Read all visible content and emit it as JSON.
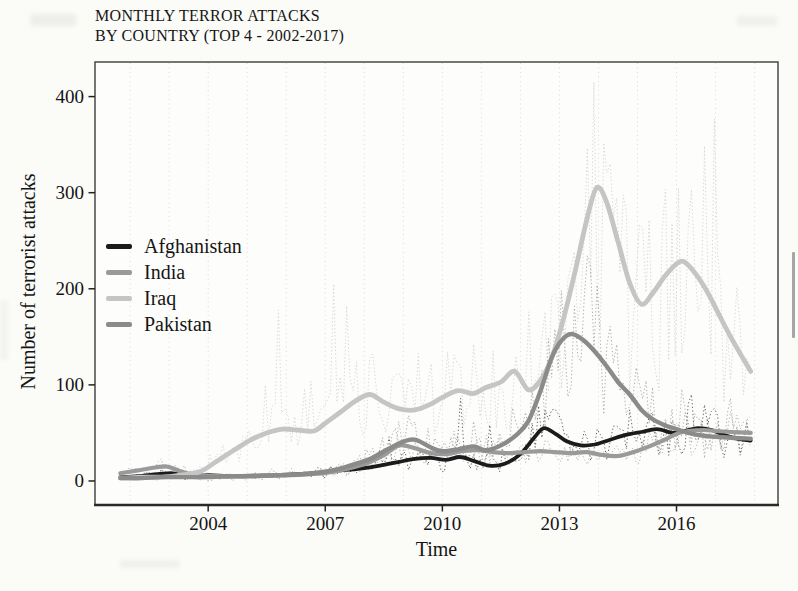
{
  "page": {
    "background": "#fbfbf8",
    "kind": "scanned book figure"
  },
  "chart_data": {
    "type": "line",
    "title_lines": [
      "MONTHLY TERROR ATTACKS",
      "BY COUNTRY (TOP 4 - 2002-2017)"
    ],
    "xlabel": "Time",
    "ylabel": "Number of terrorist attacks",
    "x_ticks": [
      2004,
      2007,
      2010,
      2013,
      2016
    ],
    "y_ticks": [
      0,
      100,
      200,
      300,
      400
    ],
    "xlim": [
      2001.1,
      2018.6
    ],
    "ylim": [
      -25,
      436
    ],
    "grid_years": [
      2002,
      2003,
      2004,
      2005,
      2006,
      2007,
      2008,
      2009,
      2010,
      2011,
      2012,
      2013,
      2014,
      2015,
      2016,
      2017,
      2018
    ],
    "grid_style": "dotted-vertical",
    "legend_position": "inside-left-middle",
    "has_raw_monthly_dotted": true,
    "series": [
      {
        "name": "Afghanistan",
        "color": "#1b1b1b",
        "raw_color": "#4d4d4d",
        "points": [
          [
            2001.75,
            4
          ],
          [
            2002.2,
            5
          ],
          [
            2002.7,
            7
          ],
          [
            2003.1,
            8
          ],
          [
            2003.5,
            5
          ],
          [
            2004.0,
            6
          ],
          [
            2004.5,
            5
          ],
          [
            2005.1,
            5
          ],
          [
            2005.7,
            6
          ],
          [
            2006.3,
            7
          ],
          [
            2006.9,
            9
          ],
          [
            2007.4,
            11
          ],
          [
            2007.9,
            13
          ],
          [
            2008.4,
            16
          ],
          [
            2008.9,
            20
          ],
          [
            2009.3,
            23
          ],
          [
            2009.7,
            24
          ],
          [
            2010.1,
            22
          ],
          [
            2010.45,
            25
          ],
          [
            2010.8,
            21
          ],
          [
            2011.2,
            16
          ],
          [
            2011.6,
            18
          ],
          [
            2012.0,
            28
          ],
          [
            2012.35,
            45
          ],
          [
            2012.6,
            55
          ],
          [
            2012.9,
            49
          ],
          [
            2013.2,
            41
          ],
          [
            2013.55,
            37
          ],
          [
            2013.9,
            38
          ],
          [
            2014.3,
            43
          ],
          [
            2014.7,
            48
          ],
          [
            2015.1,
            51
          ],
          [
            2015.5,
            54
          ],
          [
            2015.9,
            50
          ],
          [
            2016.2,
            52
          ],
          [
            2016.55,
            55
          ],
          [
            2016.9,
            53
          ],
          [
            2017.2,
            48
          ],
          [
            2017.55,
            44
          ],
          [
            2017.9,
            42
          ]
        ],
        "raw_spikes": [
          [
            2008.6,
            46
          ],
          [
            2010.5,
            86
          ],
          [
            2011.2,
            58
          ],
          [
            2012.5,
            78
          ],
          [
            2013.0,
            70
          ],
          [
            2014.8,
            74
          ],
          [
            2015.3,
            66
          ],
          [
            2016.35,
            90
          ],
          [
            2016.9,
            72
          ]
        ]
      },
      {
        "name": "India",
        "color": "#9a9a9a",
        "raw_color": "#ababab",
        "points": [
          [
            2001.75,
            8
          ],
          [
            2002.2,
            11
          ],
          [
            2002.65,
            14
          ],
          [
            2002.95,
            15
          ],
          [
            2003.3,
            10
          ],
          [
            2003.7,
            6
          ],
          [
            2004.2,
            5
          ],
          [
            2004.8,
            5
          ],
          [
            2005.4,
            6
          ],
          [
            2006.0,
            6
          ],
          [
            2006.6,
            7
          ],
          [
            2007.1,
            9
          ],
          [
            2007.6,
            13
          ],
          [
            2008.1,
            19
          ],
          [
            2008.5,
            27
          ],
          [
            2008.9,
            37
          ],
          [
            2009.3,
            34
          ],
          [
            2009.7,
            29
          ],
          [
            2010.1,
            28
          ],
          [
            2010.5,
            31
          ],
          [
            2010.9,
            32
          ],
          [
            2011.3,
            30
          ],
          [
            2011.7,
            29
          ],
          [
            2012.1,
            30
          ],
          [
            2012.5,
            31
          ],
          [
            2012.9,
            30
          ],
          [
            2013.3,
            29
          ],
          [
            2013.7,
            30
          ],
          [
            2014.1,
            27
          ],
          [
            2014.5,
            26
          ],
          [
            2014.9,
            30
          ],
          [
            2015.3,
            36
          ],
          [
            2015.7,
            43
          ],
          [
            2016.0,
            49
          ],
          [
            2016.3,
            52
          ],
          [
            2016.7,
            53
          ],
          [
            2017.0,
            52
          ],
          [
            2017.4,
            51
          ],
          [
            2017.9,
            50
          ]
        ],
        "raw_spikes": [
          [
            2008.9,
            62
          ],
          [
            2009.6,
            55
          ],
          [
            2010.3,
            52
          ],
          [
            2012.3,
            55
          ],
          [
            2016.2,
            76
          ]
        ]
      },
      {
        "name": "Iraq",
        "color": "#c5c5c5",
        "raw_color": "#d0d0d0",
        "points": [
          [
            2001.75,
            3
          ],
          [
            2002.3,
            4
          ],
          [
            2002.8,
            4
          ],
          [
            2003.3,
            6
          ],
          [
            2003.8,
            10
          ],
          [
            2004.2,
            20
          ],
          [
            2004.7,
            33
          ],
          [
            2005.1,
            43
          ],
          [
            2005.5,
            50
          ],
          [
            2005.9,
            54
          ],
          [
            2006.3,
            53
          ],
          [
            2006.7,
            52
          ],
          [
            2007.0,
            60
          ],
          [
            2007.4,
            72
          ],
          [
            2007.8,
            84
          ],
          [
            2008.15,
            90
          ],
          [
            2008.5,
            82
          ],
          [
            2008.9,
            75
          ],
          [
            2009.3,
            74
          ],
          [
            2009.7,
            80
          ],
          [
            2010.0,
            87
          ],
          [
            2010.4,
            94
          ],
          [
            2010.8,
            91
          ],
          [
            2011.1,
            97
          ],
          [
            2011.5,
            103
          ],
          [
            2011.85,
            114
          ],
          [
            2012.2,
            95
          ],
          [
            2012.5,
            104
          ],
          [
            2012.8,
            128
          ],
          [
            2013.1,
            168
          ],
          [
            2013.4,
            218
          ],
          [
            2013.7,
            272
          ],
          [
            2013.95,
            305
          ],
          [
            2014.2,
            291
          ],
          [
            2014.5,
            249
          ],
          [
            2014.8,
            206
          ],
          [
            2015.1,
            184
          ],
          [
            2015.4,
            196
          ],
          [
            2015.7,
            213
          ],
          [
            2016.0,
            226
          ],
          [
            2016.2,
            228
          ],
          [
            2016.5,
            215
          ],
          [
            2016.8,
            196
          ],
          [
            2017.1,
            172
          ],
          [
            2017.4,
            149
          ],
          [
            2017.9,
            114
          ]
        ],
        "raw_spikes": [
          [
            2005.45,
            100
          ],
          [
            2005.8,
            178
          ],
          [
            2006.5,
            96
          ],
          [
            2007.2,
            205
          ],
          [
            2007.55,
            182
          ],
          [
            2008.2,
            132
          ],
          [
            2009.75,
            122
          ],
          [
            2010.3,
            131
          ],
          [
            2011.9,
            130
          ],
          [
            2012.2,
            176
          ],
          [
            2013.2,
            210
          ],
          [
            2013.92,
            415
          ],
          [
            2014.1,
            352
          ],
          [
            2015.0,
            212
          ],
          [
            2015.9,
            268
          ],
          [
            2016.45,
            224
          ],
          [
            2017.1,
            200
          ],
          [
            2017.5,
            152
          ]
        ]
      },
      {
        "name": "Pakistan",
        "color": "#8b8b8b",
        "raw_color": "#a0a0a0",
        "points": [
          [
            2001.75,
            3
          ],
          [
            2002.3,
            3
          ],
          [
            2002.8,
            4
          ],
          [
            2003.4,
            4
          ],
          [
            2004.0,
            4
          ],
          [
            2004.6,
            5
          ],
          [
            2005.2,
            5
          ],
          [
            2005.8,
            6
          ],
          [
            2006.4,
            7
          ],
          [
            2006.9,
            9
          ],
          [
            2007.3,
            12
          ],
          [
            2007.8,
            18
          ],
          [
            2008.2,
            24
          ],
          [
            2008.6,
            33
          ],
          [
            2009.0,
            41
          ],
          [
            2009.3,
            43
          ],
          [
            2009.7,
            35
          ],
          [
            2010.0,
            31
          ],
          [
            2010.4,
            33
          ],
          [
            2010.8,
            36
          ],
          [
            2011.1,
            32
          ],
          [
            2011.5,
            37
          ],
          [
            2011.9,
            48
          ],
          [
            2012.2,
            62
          ],
          [
            2012.5,
            92
          ],
          [
            2012.8,
            128
          ],
          [
            2013.05,
            146
          ],
          [
            2013.3,
            153
          ],
          [
            2013.6,
            147
          ],
          [
            2013.9,
            135
          ],
          [
            2014.2,
            120
          ],
          [
            2014.5,
            103
          ],
          [
            2014.8,
            90
          ],
          [
            2015.1,
            74
          ],
          [
            2015.4,
            64
          ],
          [
            2015.7,
            58
          ],
          [
            2016.0,
            54
          ],
          [
            2016.3,
            50
          ],
          [
            2016.7,
            47
          ],
          [
            2017.0,
            46
          ],
          [
            2017.4,
            45
          ],
          [
            2017.9,
            44
          ]
        ],
        "raw_spikes": [
          [
            2009.15,
            68
          ],
          [
            2010.8,
            62
          ],
          [
            2012.85,
            158
          ],
          [
            2013.35,
            182
          ],
          [
            2014.0,
            204
          ],
          [
            2015.0,
            118
          ],
          [
            2016.5,
            70
          ]
        ]
      }
    ]
  }
}
